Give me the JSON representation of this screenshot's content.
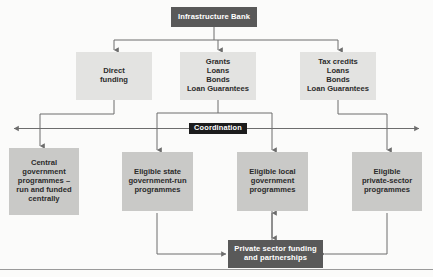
{
  "diagram": {
    "colors": {
      "dark_box": "#595959",
      "light_box": "#e3e3e1",
      "grey_box": "#c9c9c7",
      "black_box": "#1c1c1c",
      "line": "#6d6d6d",
      "background": "#fbfbfa"
    },
    "nodes": {
      "infrastructure_bank": "Infrastructure Bank",
      "direct_funding": "Direct\nfunding",
      "grants_group": "Grants\nLoans\nBonds\nLoan Guarantees",
      "tax_credits_group": "Tax credits\nLoans\nBonds\nLoan Guarantees",
      "coordination": "Coordination",
      "central_government": "Central\ngovernment\nprogrammes –\nrun and funded\ncentrally",
      "eligible_state": "Eligible state\ngovernment-run\nprogrammes",
      "eligible_local": "Eligible local\ngovernment\nprogrammes",
      "eligible_private": "Eligible\nprivate-sector\nprogrammes",
      "private_funding": "Private sector funding\nand partnerships"
    }
  }
}
